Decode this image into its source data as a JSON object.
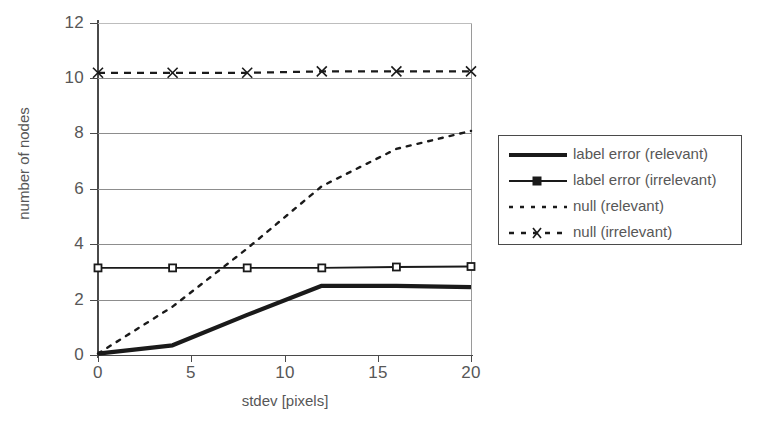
{
  "chart_data": {
    "type": "line",
    "title": "",
    "xlabel": "stdev [pixels]",
    "ylabel": "number of nodes",
    "xlim": [
      0,
      20
    ],
    "ylim": [
      0,
      12
    ],
    "xticks": [
      0,
      5,
      10,
      15,
      20
    ],
    "yticks": [
      0,
      2,
      4,
      6,
      8,
      10,
      12
    ],
    "xtick_labels": [
      "0",
      "5",
      "10",
      "15",
      "20"
    ],
    "ytick_labels": [
      "0",
      "2",
      "4",
      "6",
      "8",
      "10",
      "12"
    ],
    "grid": "horizontal",
    "legend_position": "right-outside",
    "x": [
      0,
      4,
      8,
      12,
      16,
      20
    ],
    "series": [
      {
        "name": "label error (relevant)",
        "style": "solid-thick",
        "marker": "none",
        "color": "#1a1a1a",
        "values": [
          0.05,
          0.35,
          1.45,
          2.5,
          2.5,
          2.45
        ]
      },
      {
        "name": "label error (irrelevant)",
        "style": "solid-thin",
        "marker": "square",
        "color": "#1a1a1a",
        "values": [
          3.15,
          3.15,
          3.15,
          3.15,
          3.18,
          3.2
        ]
      },
      {
        "name": "null  (relevant)",
        "style": "dotted",
        "marker": "none",
        "color": "#1a1a1a",
        "values": [
          0.05,
          1.75,
          3.85,
          6.1,
          7.45,
          8.1
        ]
      },
      {
        "name": "null (irrelevant)",
        "style": "dashed",
        "marker": "x",
        "color": "#1a1a1a",
        "values": [
          10.2,
          10.2,
          10.2,
          10.25,
          10.25,
          10.25
        ]
      }
    ]
  },
  "legend": {
    "entries": [
      {
        "label": "label error (relevant)",
        "sample": "solid-thick-line"
      },
      {
        "label": "label error (irrelevant)",
        "sample": "solid-line-square-marker"
      },
      {
        "label": "null  (relevant)",
        "sample": "dotted-line"
      },
      {
        "label": "null (irrelevant)",
        "sample": "dashed-line-x-marker"
      }
    ]
  }
}
